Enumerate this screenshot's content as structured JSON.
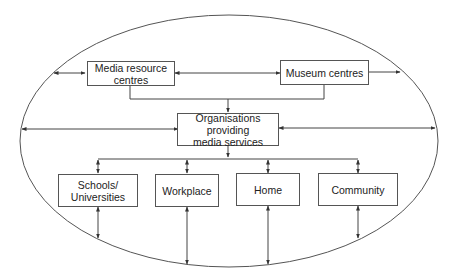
{
  "diagram": {
    "type": "flow-ellipse",
    "colors": {
      "line": "#444444",
      "box_border": "#555555",
      "text": "#222222",
      "background": "#ffffff"
    },
    "nodes": {
      "media_resource": {
        "line1": "Media resource",
        "line2": "centres"
      },
      "museum": {
        "label": "Museum centres"
      },
      "organisations": {
        "line1": "Organisations providing",
        "line2": "media services"
      },
      "schools": {
        "line1": "Schools/",
        "line2": "Universities"
      },
      "workplace": {
        "label": "Workplace"
      },
      "home": {
        "label": "Home"
      },
      "community": {
        "label": "Community"
      }
    },
    "edges": [
      {
        "from": "ellipse",
        "to": "Media resource centres",
        "style": "bidirectional"
      },
      {
        "from": "Media resource centres",
        "to": "Museum centres",
        "style": "bidirectional"
      },
      {
        "from": "Museum centres",
        "to": "ellipse",
        "style": "arrow"
      },
      {
        "from": "Media resource centres",
        "to": "Organisations providing media services",
        "style": "arrow"
      },
      {
        "from": "Museum centres",
        "to": "Organisations providing media services",
        "style": "arrow"
      },
      {
        "from": "ellipse",
        "to": "Organisations providing media services",
        "style": "bidirectional"
      },
      {
        "from": "Organisations providing media services",
        "to": "ellipse",
        "style": "bidirectional"
      },
      {
        "from": "Organisations providing media services",
        "to": "Schools/Universities",
        "style": "bidirectional"
      },
      {
        "from": "Organisations providing media services",
        "to": "Workplace",
        "style": "bidirectional"
      },
      {
        "from": "Organisations providing media services",
        "to": "Home",
        "style": "bidirectional"
      },
      {
        "from": "Organisations providing media services",
        "to": "Community",
        "style": "bidirectional"
      },
      {
        "from": "Schools/Universities",
        "to": "ellipse",
        "style": "bidirectional"
      },
      {
        "from": "Workplace",
        "to": "ellipse",
        "style": "bidirectional"
      },
      {
        "from": "Home",
        "to": "ellipse",
        "style": "bidirectional"
      },
      {
        "from": "Community",
        "to": "ellipse",
        "style": "bidirectional"
      }
    ]
  }
}
